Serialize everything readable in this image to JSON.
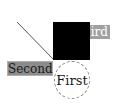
{
  "diagram": {
    "labels": {
      "first": "First",
      "second": "Second",
      "third": "ird"
    },
    "colors": {
      "square": "#000000",
      "second_bg": "#8c8c8c",
      "third_bg": "#a0a0a0",
      "circle_border": "#888888",
      "line": "#555555"
    }
  }
}
